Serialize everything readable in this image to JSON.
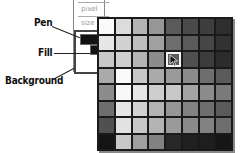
{
  "panel": {
    "fields": [
      "pixel",
      "size"
    ]
  },
  "labels": {
    "pen": "Pen",
    "fill": "Fill",
    "background": "Background"
  },
  "swatches": {
    "pen_color": "#111111",
    "fill_color": "#111111",
    "background_color": "#ffffff"
  },
  "palette": {
    "rows": 8,
    "cols": 8,
    "selected": {
      "row": 2,
      "col": 4
    },
    "colors": [
      [
        "#fafafa",
        "#dcdcdc",
        "#b4b4b4",
        "#969696",
        "#5a5a5a",
        "#4a4a4a",
        "#3e3e3e",
        "#2e2e2e"
      ],
      [
        "#e6e6e6",
        "#d2d2d2",
        "#bebebe",
        "#a0a0a0",
        "#6e6e6e",
        "#5a5a5a",
        "#464646",
        "#323232"
      ],
      [
        "#c8c8c8",
        "#d0d0d0",
        "#b4b4b4",
        "#8c8c8c",
        "#5a5a5a",
        "#505050",
        "#3c3c3c",
        "#2c2c2c"
      ],
      [
        "#aaaaaa",
        "#fafafa",
        "#c8c8c8",
        "#aaaaaa",
        "#9a9a9a",
        "#8c8c8c",
        "#6e6e6e",
        "#5a5a5a"
      ],
      [
        "#8c8c8c",
        "#f8f8f8",
        "#e6e6e6",
        "#cecece",
        "#c8c8c8",
        "#a4a4a4",
        "#8c8c8c",
        "#7a7a7a"
      ],
      [
        "#6e6e6e",
        "#e6e6e6",
        "#d2d2d2",
        "#b4b4b4",
        "#969696",
        "#828282",
        "#6e6e6e",
        "#5a5a5a"
      ],
      [
        "#505050",
        "#e2e2e2",
        "#c8c8c8",
        "#b4b4b4",
        "#9a9a9a",
        "#8a8a8a",
        "#828282",
        "#6e6e6e"
      ],
      [
        "#141414",
        "#c8c8c8",
        "#a0a0a0",
        "#828282",
        "#282828",
        "#202020",
        "#1e1e1e",
        "#161616"
      ]
    ]
  }
}
